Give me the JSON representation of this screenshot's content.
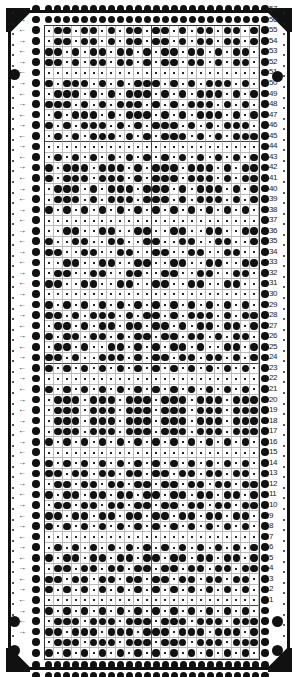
{
  "card": {
    "type": "knitting machine punch card",
    "columns": 24,
    "row_count": 57,
    "row_numbers_visible": [
      "57",
      "56",
      "55",
      "54",
      "53",
      "52",
      "51",
      "50",
      "49",
      "48",
      "47",
      "46",
      "45",
      "44",
      "43",
      "42",
      "41",
      "40",
      "39",
      "38",
      "37",
      "36",
      "35",
      "34",
      "33",
      "32",
      "31",
      "30",
      "29",
      "28",
      "27",
      "26",
      "25",
      "24",
      "23",
      "22",
      "21",
      "20",
      "19",
      "18",
      "17",
      "16",
      "15",
      "14",
      "13",
      "12",
      "11",
      "10",
      "9",
      "8",
      "7",
      "6",
      "5",
      "4",
      "3",
      "2",
      "1"
    ],
    "pattern_rows_top_to_bottom": [
      {
        "row": "55",
        "cells": ".XX.XX.X.XX.XX.X.XX.XX.X"
      },
      {
        "row": "54",
        "cells": ".XX.XX.X.XX.XX.X.XX.XX.X"
      },
      {
        "row": "53",
        "cells": "XX.X.XX.XX.X.XX.XX.X.XX."
      },
      {
        "row": "52",
        "cells": "XX.X.XX.XX.X.XX.XX.X.XX."
      },
      {
        "row": "51",
        "cells": "........................"
      },
      {
        "row": "50",
        "cells": "X.XXX.X.X.XXX.X.X.XXX.X."
      },
      {
        "row": "49",
        "cells": ".XXX.X.X.XXX.X.X.XXX.X.X"
      },
      {
        "row": "48",
        "cells": "XXX.X.X.XXX.X.X.XXX.X.X."
      },
      {
        "row": "47",
        "cells": ".X.XXX.X.XXX.X.X.XXX.X.X"
      },
      {
        "row": "46",
        "cells": "X.X.XXX.X.X.XXX.X.X.XXX."
      },
      {
        "row": "45",
        "cells": ".X.X.XXX.X.X.XXX.X.X.XXX"
      },
      {
        "row": "44",
        "cells": "........................"
      },
      {
        "row": "43",
        "cells": ".X.X.X.X.X.X.X.X.X.X.X.X"
      },
      {
        "row": "42",
        "cells": "X.XXX.XXX.X.XXX.XXX.X.XX"
      },
      {
        "row": "41",
        "cells": "X.XXX.XXX.X.XXX.XXX.X.XX"
      },
      {
        "row": "40",
        "cells": ".XXX.X.XXX.XXX.X.XXX.X.X"
      },
      {
        "row": "39",
        "cells": ".XXX.X.XXX.XXX.X.XXX.X.X"
      },
      {
        "row": "38",
        "cells": "X.X.X.X.X.X.X.X.X.X.X.X."
      },
      {
        "row": "37",
        "cells": "........................"
      },
      {
        "row": "36",
        "cells": "..XX..XX..XX..XX..XX..XX"
      },
      {
        "row": "35",
        "cells": "X..XX..XX..XX..XX..XX..X"
      },
      {
        "row": "34",
        "cells": "XX..XX..XX..XX..XX..XX.."
      },
      {
        "row": "33",
        "cells": "..XX..XX..XX..XX..XX..XX"
      },
      {
        "row": "32",
        "cells": ".XX..XX..XX..XX..XX..XX."
      },
      {
        "row": "31",
        "cells": "XX..XX..XX..XX..XX..XX.."
      },
      {
        "row": "30",
        "cells": "........................"
      },
      {
        "row": "29",
        "cells": "X.X.X.X.X.X.X.X.X.X.X.X."
      },
      {
        "row": "28",
        "cells": "XX.X.XXX.X.XX.X.XXX.X.XX"
      },
      {
        "row": "27",
        "cells": ".XX.X.XX.XX.XX.X.XX.XX.X"
      },
      {
        "row": "26",
        "cells": "X.XX.XX.X.XX.XX.XX.X.XX."
      },
      {
        "row": "25",
        "cells": ".XX.X..XX.X.X.XX.X..XX.X"
      },
      {
        "row": "24",
        "cells": "XX.X..XXX.X.XX.XX.XX.X.X"
      },
      {
        "row": "23",
        "cells": "X.X.X.X.X.X.X.X.X.X.X.X."
      },
      {
        "row": "22",
        "cells": "........................"
      },
      {
        "row": "21",
        "cells": "X.X.X.X.X.X.X.X.X.X.X.X."
      },
      {
        "row": "20",
        "cells": ".XXX.XXX.XXX.XXX.XXX.XXX"
      },
      {
        "row": "19",
        "cells": ".XXX.XXX.XXX.XXX.XXX.XXX"
      },
      {
        "row": "18",
        "cells": ".XXX.XXX.XXX.XXX.XXX.XXX"
      },
      {
        "row": "17",
        "cells": ".XXX.XXX.XXX.XXX.XXX.XXX"
      },
      {
        "row": "16",
        "cells": "X.X.X.X.X.X.X.X.X.X.X.X."
      },
      {
        "row": "15",
        "cells": "........................"
      },
      {
        "row": "14",
        "cells": "X.X.X.X.X.X.X.X.X.X.X.X."
      },
      {
        "row": "13",
        "cells": "XX.XX.XX.XX.XX.XX.XX.XX."
      },
      {
        "row": "12",
        "cells": ".XX.XX.XX.XX.XX.XX.XX.XX"
      },
      {
        "row": "11",
        "cells": "X.XX.XX.XX.XX.XX.XX.XX.X"
      },
      {
        "row": "10",
        "cells": ".XX.XX.XX.XX.XX.XX.XX.XX"
      },
      {
        "row": "9",
        "cells": "XX.XX.XX.XX.XX.XX.XX.XX."
      },
      {
        "row": "8",
        "cells": "X.X.X.X.X.X.X.X.X.X.X.X."
      },
      {
        "row": "7",
        "cells": "........................"
      },
      {
        "row": "6",
        "cells": ".X.X.X.X.X.X.X.X.X.X.X.X"
      },
      {
        "row": "5",
        "cells": "X.XX.XX.XX.XX.XX.XX.XX.X"
      },
      {
        "row": "4",
        "cells": ".XX.XX.XX.XX.XX.XX.XX.XX"
      },
      {
        "row": "3",
        "cells": "XX.XX.XX.XX.XX.XX.XX.XX."
      },
      {
        "row": "2",
        "cells": "X.X.X.X.X.X.X.X.X.X.X.X."
      },
      {
        "row": "1",
        "cells": "........................"
      },
      {
        "row": "",
        "cells": "X.X.X.X.X.X.X.X.X.X.X.X."
      },
      {
        "row": "",
        "cells": ".XXX.XXX.XXX.XXX.XXX.XXX"
      },
      {
        "row": "",
        "cells": "XX.XXX.XXX.XXX.XXX.XXX.X"
      },
      {
        "row": "",
        "cells": ".XXX.XXX.XXX.XXX.XXX.XXX"
      },
      {
        "row": "",
        "cells": "X.X.X.X.X.X.X.X.X.X.X.X."
      }
    ],
    "edge_arrows": [
      "←",
      "→"
    ],
    "colors": {
      "ink": "#111111",
      "paper": "#ffffff",
      "gridline": "#bbbbbb"
    }
  }
}
